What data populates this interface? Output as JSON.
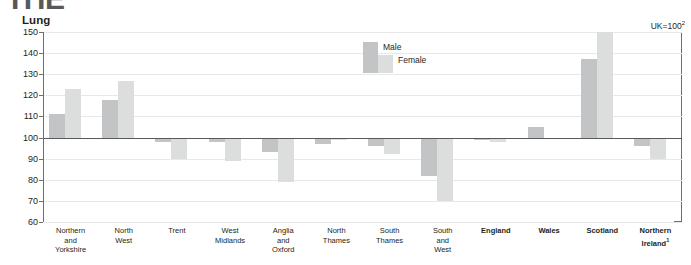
{
  "page": {
    "cut_title": "THE",
    "panel_title": "Lung",
    "uk_note": "UK=100",
    "uk_note_sup": "2"
  },
  "legend": {
    "position": "inside-top-center",
    "male_label": "Male",
    "female_label": "Female"
  },
  "colors": {
    "male": "#c3c4c6",
    "female": "#dcdddd",
    "axis": "#6d6e71",
    "grid": "#e8e8e8",
    "text": "#231f20",
    "cut_title": "#58585a"
  },
  "chart_data": {
    "type": "bar",
    "title": "Lung",
    "subtitle": "UK=100",
    "xlabel": "",
    "ylabel": "",
    "ylim": [
      60,
      150
    ],
    "yticks": [
      60,
      70,
      80,
      90,
      100,
      110,
      120,
      130,
      140,
      150
    ],
    "grid": true,
    "reference_line": 100,
    "legend": [
      "Male",
      "Female"
    ],
    "categories": [
      "Northern and Yorkshire",
      "North West",
      "Trent",
      "West Midlands",
      "Anglia and Oxford",
      "North Thames",
      "South Thames",
      "South and West",
      "England",
      "Wales",
      "Scotland",
      "Northern Ireland"
    ],
    "category_labels": [
      [
        "Northern",
        "and",
        "Yorkshire"
      ],
      [
        "North",
        "West"
      ],
      [
        "Trent"
      ],
      [
        "West",
        "Midlands"
      ],
      [
        "Anglia",
        "and",
        "Oxford"
      ],
      [
        "North",
        "Thames"
      ],
      [
        "South",
        "Thames"
      ],
      [
        "South",
        "and",
        "West"
      ],
      [
        "England"
      ],
      [
        "Wales"
      ],
      [
        "Scotland"
      ],
      [
        "Northern",
        "Ireland"
      ]
    ],
    "bold_categories": [
      "England",
      "Wales",
      "Scotland",
      "Northern Ireland"
    ],
    "footnote_categories": [
      "Northern Ireland"
    ],
    "footnote_marker": "1",
    "series": [
      {
        "name": "Male",
        "color": "#c3c4c6",
        "values": [
          111,
          118,
          98,
          98,
          93,
          97,
          96,
          82,
          99,
          105,
          137,
          96
        ]
      },
      {
        "name": "Female",
        "color": "#dcdddd",
        "values": [
          123,
          127,
          90,
          89,
          79,
          99,
          92,
          70,
          98,
          100,
          150,
          90
        ]
      }
    ]
  }
}
